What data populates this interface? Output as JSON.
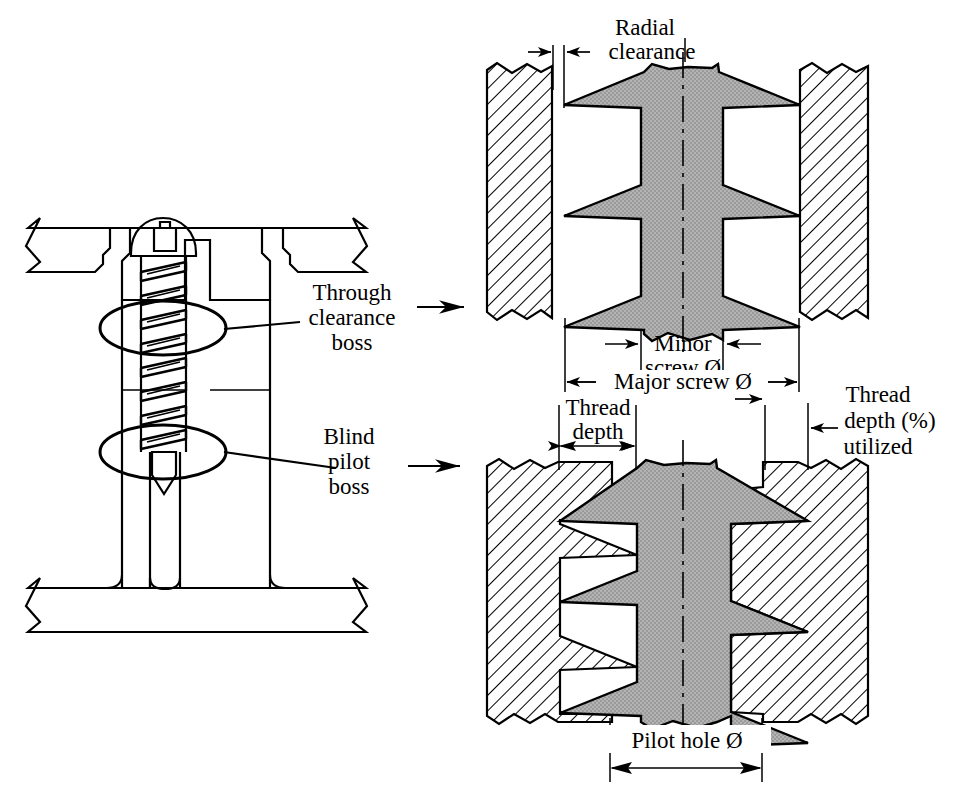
{
  "figure": {
    "colors": {
      "line": "#000000",
      "screw_fill": "#a8a8a8",
      "background": "#ffffff",
      "hatch_fill": "#ffffff"
    }
  },
  "assembly": {
    "name": "screw-in-boss-assembly",
    "callouts": [
      {
        "id": "through-clearance-boss",
        "lines": [
          "Through",
          "clearance",
          "boss"
        ]
      },
      {
        "id": "blind-pilot-boss",
        "lines": [
          "Blind",
          "pilot",
          "boss"
        ]
      }
    ]
  },
  "detail_top": {
    "name": "through-clearance-boss-detail",
    "labels": {
      "radial_clearance": [
        "Radial",
        "clearance"
      ],
      "minor_screw_dia": [
        "Minor",
        "screw Ø"
      ],
      "major_screw_dia": "Major screw Ø"
    }
  },
  "detail_bottom": {
    "name": "blind-pilot-boss-detail",
    "labels": {
      "thread_depth": [
        "Thread",
        "depth"
      ],
      "thread_depth_utilized": [
        "Thread",
        "depth (%)",
        "utilized"
      ],
      "pilot_hole_dia": "Pilot hole Ø"
    }
  }
}
